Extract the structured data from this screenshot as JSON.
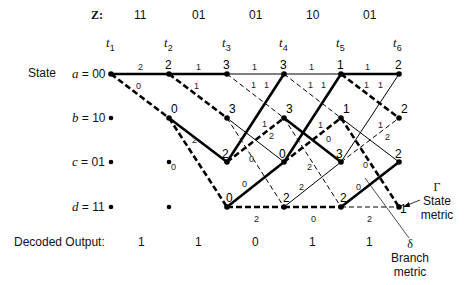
{
  "header": {
    "z_label": "Z:",
    "received": [
      "11",
      "01",
      "01",
      "10",
      "01"
    ],
    "times": [
      {
        "base": "t",
        "sub": "1"
      },
      {
        "base": "t",
        "sub": "2"
      },
      {
        "base": "t",
        "sub": "3"
      },
      {
        "base": "t",
        "sub": "4"
      },
      {
        "base": "t",
        "sub": "5"
      },
      {
        "base": "t",
        "sub": "6"
      }
    ]
  },
  "states": {
    "title": "State",
    "rows": [
      {
        "letter": "a",
        "code": " = 00"
      },
      {
        "letter": "b",
        "code": " = 10"
      },
      {
        "letter": "c",
        "code": " = 01"
      },
      {
        "letter": "d",
        "code": " = 11"
      }
    ]
  },
  "state_metrics": {
    "t2": {
      "a": "2",
      "b": "0"
    },
    "t3": {
      "a": "3",
      "b": "3",
      "c": "2",
      "d": "0"
    },
    "t4": {
      "a": "3",
      "b": "3",
      "c": "0",
      "d": "2"
    },
    "t5": {
      "a": "1",
      "b": "1",
      "c": "3",
      "d": "2"
    },
    "t6": {
      "a": "2",
      "b": "2",
      "c": "2",
      "d": "1"
    }
  },
  "annotations": {
    "state_metric_symbol": "Γ",
    "state_metric_label_1": "State",
    "state_metric_label_2": "metric",
    "branch_metric_symbol": "δ",
    "branch_metric_label_1": "Branch",
    "branch_metric_label_2": "metric"
  },
  "decoded": {
    "label": "Decoded Output:",
    "bits": [
      "1",
      "1",
      "0",
      "1",
      "1"
    ]
  },
  "legend_semantics": {
    "solid_line": "input bit 0",
    "dashed_line": "input bit 1",
    "thick_line": "surviving path"
  }
}
